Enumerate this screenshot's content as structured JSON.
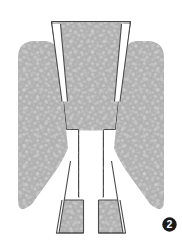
{
  "figure": {
    "label": "Figure 2",
    "caption_number": "2",
    "badge": {
      "name": "figure-number-badge",
      "text": "2",
      "shape": "filled-circle",
      "fill_color": "#1a1a1a",
      "text_color": "#ffffff"
    },
    "background_color": "#ffffff",
    "specimen": {
      "name": "speckled-symmetric-specimen",
      "description": "Symmetric M-shaped cross-section outline with stippled gray fill",
      "fill_color": "#b2b2b2",
      "fill_texture": "fine-random-speckle",
      "speckle_light_color": "#c9c9c9",
      "speckle_dark_color": "#a2a2a2",
      "outline_color": "#4a4a4a",
      "outline_width": "1",
      "parts": [
        {
          "name": "central-crown",
          "label": "Central crown",
          "outlined": true
        },
        {
          "name": "left-arm",
          "label": "Left arm",
          "outlined": false
        },
        {
          "name": "right-arm",
          "label": "Right arm",
          "outlined": false
        },
        {
          "name": "left-leg",
          "label": "Left leg",
          "outlined": true
        },
        {
          "name": "right-leg",
          "label": "Right leg",
          "outlined": true
        }
      ],
      "gaps": [
        {
          "name": "left-upper-wedge-gap",
          "label": "Left upper wedge gap"
        },
        {
          "name": "right-upper-wedge-gap",
          "label": "Right upper wedge gap"
        },
        {
          "name": "central-vertical-slot",
          "label": "Central vertical slot"
        },
        {
          "name": "left-lower-wedge-gap",
          "label": "Left lower wedge gap"
        },
        {
          "name": "right-lower-wedge-gap",
          "label": "Right lower wedge gap"
        },
        {
          "name": "bottom-leg-gap",
          "label": "Bottom leg gap"
        }
      ]
    }
  }
}
